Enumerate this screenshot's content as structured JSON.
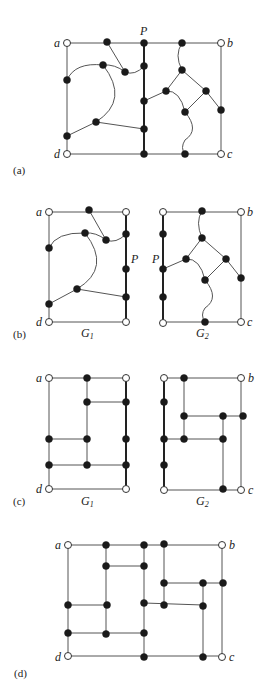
{
  "panels": [
    {
      "id": "a",
      "label": "(a)",
      "path_label": "P",
      "corners": {
        "a": "a",
        "b": "b",
        "c": "c",
        "d": "d"
      }
    },
    {
      "id": "b",
      "label": "(b)",
      "path_label_left": "P",
      "path_label_right": "P",
      "graph1": "G",
      "graph1_sub": "1",
      "graph2": "G",
      "graph2_sub": "2",
      "corners": {
        "a": "a",
        "b": "b",
        "c": "c",
        "d": "d"
      }
    },
    {
      "id": "c",
      "label": "(c)",
      "graph1": "G",
      "graph1_sub": "1",
      "graph2": "G",
      "graph2_sub": "2",
      "corners": {
        "a": "a",
        "b": "b",
        "c": "c",
        "d": "d"
      }
    },
    {
      "id": "d",
      "label": "(d)",
      "corners": {
        "a": "a",
        "b": "b",
        "c": "c",
        "d": "d"
      }
    }
  ],
  "colors": {
    "node_filled": "#1a1a1a",
    "node_open": "#ffffff",
    "edge": "#555555"
  }
}
